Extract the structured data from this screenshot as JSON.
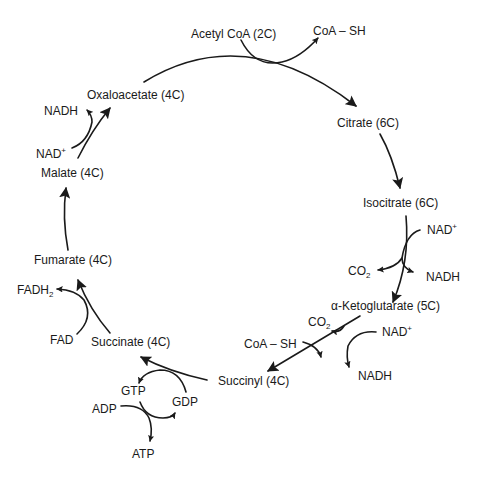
{
  "diagram": {
    "metabolites": {
      "acetyl_coa": "Acetyl CoA (2C)",
      "citrate": "Citrate (6C)",
      "isocitrate": "Isocitrate (6C)",
      "ketoglutarate": "α-Ketoglutarate (5C)",
      "succinyl": "Succinyl (4C)",
      "succinate": "Succinate (4C)",
      "fumarate": "Fumarate (4C)",
      "malate": "Malate (4C)",
      "oxaloacetate": "Oxaloacetate (4C)"
    },
    "cofactors": {
      "coa_sh_top": "CoA – SH",
      "nad_isocitrate": "NAD",
      "nad_isocitrate_sup": "+",
      "co2_isocitrate": "CO",
      "co2_isocitrate_sub": "2",
      "nadh_isocitrate": "NADH",
      "co2_kg": "CO",
      "co2_kg_sub": "2",
      "nad_kg": "NAD",
      "nad_kg_sup": "+",
      "coa_sh_kg": "CoA – SH",
      "nadh_kg": "NADH",
      "gtp": "GTP",
      "gdp": "GDP",
      "adp": "ADP",
      "atp": "ATP",
      "fad": "FAD",
      "fadh2": "FADH",
      "fadh2_sub": "2",
      "nad_malate": "NAD",
      "nad_malate_sup": "+",
      "nadh_malate": "NADH"
    },
    "colors": {
      "ink": "#1a1a1a",
      "background": "#ffffff"
    }
  }
}
